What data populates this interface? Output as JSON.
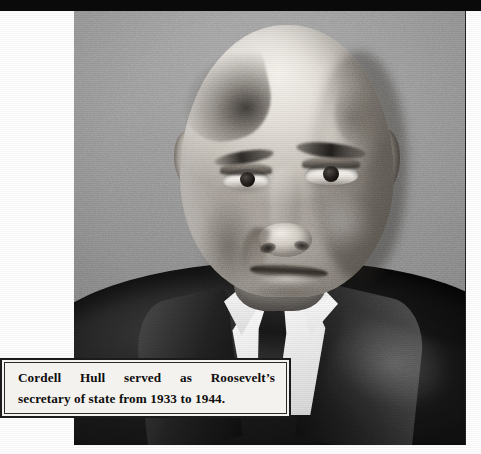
{
  "page": {
    "type": "book-page-photograph-with-caption",
    "background_color": "#ffffff",
    "width": 481,
    "height": 454
  },
  "top_band": {
    "name": "page-edge-band",
    "color": "#0a0a0a"
  },
  "photograph": {
    "alt": "Black and white portrait photograph of Cordell Hull, an elderly man with thin receding grey hair wearing a dark suit, white shirt and dark tie, against a plain grey studio backdrop",
    "subject": "Cordell Hull",
    "tonality": "black-and-white",
    "backdrop_color": "#8b8b8b",
    "suit_color": "#1a1a1a",
    "shirt_color": "#fbfbfb",
    "frame": {
      "left": 74,
      "top": 11,
      "width": 392,
      "height": 434
    }
  },
  "caption": {
    "line_1": "Cordell Hull served as Roosevelt’s",
    "line_2": "secretary of state from 1933 to 1944.",
    "full_text": "Cordell Hull served as Roosevelt’s secretary of state from 1933 to 1944.",
    "background_color": "#f4f2ee",
    "border_color": "#1b1b1b",
    "text_color": "#0e0e0e"
  }
}
